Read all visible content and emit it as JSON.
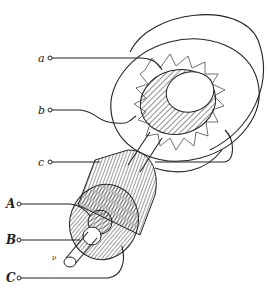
{
  "diagram": {
    "stator_terminals": [
      {
        "label": "a",
        "y": 58
      },
      {
        "label": "b",
        "y": 110
      },
      {
        "label": "c",
        "y": 162
      }
    ],
    "rotor_terminals": [
      {
        "label": "A",
        "y": 204
      },
      {
        "label": "B",
        "y": 240
      },
      {
        "label": "C",
        "y": 278
      }
    ],
    "shaft_label": "ν",
    "line_color": "#222222",
    "background": "#ffffff"
  }
}
